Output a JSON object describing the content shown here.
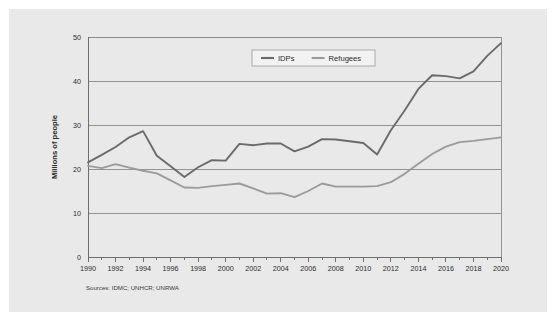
{
  "figure": {
    "background_color": "#e9e9e9",
    "page_background_color": "#ffffff",
    "source_note": "Sources: IDMC; UNHCR; UNRWA"
  },
  "chart_data": {
    "type": "line",
    "title": "",
    "subtitle": "",
    "xlabel": "",
    "ylabel": "Millions of people",
    "x": [
      1990,
      1991,
      1992,
      1993,
      1994,
      1995,
      1996,
      1997,
      1998,
      1999,
      2000,
      2001,
      2002,
      2003,
      2004,
      2005,
      2006,
      2007,
      2008,
      2009,
      2010,
      2011,
      2012,
      2013,
      2014,
      2015,
      2016,
      2017,
      2018,
      2019,
      2020
    ],
    "xlim": [
      1990,
      2020
    ],
    "ylim": [
      0,
      50
    ],
    "xticks": [
      1990,
      1992,
      1994,
      1996,
      1998,
      2000,
      2002,
      2004,
      2006,
      2008,
      2010,
      2012,
      2014,
      2016,
      2018,
      2020
    ],
    "xtick_labels": [
      "1990",
      "1992",
      "1994",
      "1996",
      "1998",
      "2000",
      "2002",
      "2004",
      "2006",
      "2008",
      "2010",
      "2012",
      "2014",
      "2016",
      "2018",
      "2020"
    ],
    "yticks": [
      0,
      10,
      20,
      30,
      40,
      50
    ],
    "ytick_labels": [
      "0",
      "10",
      "20",
      "30",
      "40",
      "50"
    ],
    "grid": "horizontal",
    "legend_position": "top-center",
    "series": [
      {
        "name": "IDPs",
        "color": "#6a6a6a",
        "values": [
          21.5,
          23.2,
          25.0,
          27.2,
          28.6,
          23.0,
          20.6,
          18.2,
          20.4,
          22.0,
          21.9,
          25.7,
          25.4,
          25.8,
          25.8,
          24.0,
          25.1,
          26.8,
          26.7,
          26.3,
          25.9,
          23.3,
          28.8,
          33.3,
          38.2,
          41.3,
          41.1,
          40.6,
          42.2,
          45.7,
          48.6
        ]
      },
      {
        "name": "Refugees",
        "color": "#9b9b9b",
        "values": [
          20.7,
          20.2,
          21.1,
          20.3,
          19.6,
          19.0,
          17.4,
          15.8,
          15.7,
          16.1,
          16.4,
          16.7,
          15.6,
          14.4,
          14.5,
          13.6,
          15.0,
          16.7,
          16.0,
          16.0,
          16.0,
          16.1,
          17.0,
          18.9,
          21.2,
          23.4,
          25.1,
          26.1,
          26.4,
          26.8,
          27.2
        ]
      }
    ]
  },
  "legend": {
    "items": [
      {
        "label": "IDPs",
        "color": "#6a6a6a"
      },
      {
        "label": "Refugees",
        "color": "#9b9b9b"
      }
    ]
  },
  "axes": {
    "y_axis_title": "Millions of people"
  }
}
